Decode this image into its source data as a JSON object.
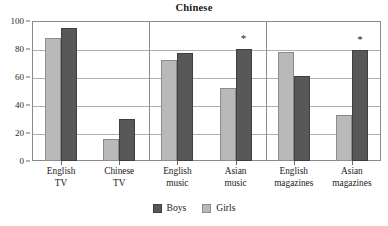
{
  "chart_data": {
    "type": "bar",
    "title": "Chinese",
    "xlabel": "",
    "ylabel": "",
    "ylim": [
      0,
      100
    ],
    "yticks": [
      0,
      20,
      40,
      60,
      80,
      100
    ],
    "ytick_labels": [
      "0",
      "20",
      "40",
      "60",
      "80",
      "100"
    ],
    "grid": true,
    "legend_position": "bottom",
    "categories": [
      "English TV",
      "Chinese TV",
      "English music",
      "Asian music",
      "English magazines",
      "Asian magazines"
    ],
    "category_lines": [
      [
        "English",
        "TV"
      ],
      [
        "Chinese",
        "TV"
      ],
      [
        "English",
        "music"
      ],
      [
        "Asian",
        "music"
      ],
      [
        "English",
        "magazines"
      ],
      [
        "Asian",
        "magazines"
      ]
    ],
    "series": [
      {
        "name": "Girls",
        "color": "#b9b9b9",
        "values": [
          88,
          16,
          72,
          52,
          78,
          33
        ]
      },
      {
        "name": "Boys",
        "color": "#585858",
        "values": [
          95,
          30,
          77,
          80,
          61,
          79
        ]
      }
    ],
    "legend_order": [
      "Boys",
      "Girls"
    ],
    "annotations": [
      {
        "symbol": "*",
        "category": "Asian music",
        "series": "Boys",
        "value": 80
      },
      {
        "symbol": "*",
        "category": "Asian magazines",
        "series": "Boys",
        "value": 79
      }
    ],
    "panel_groups": [
      [
        "English TV",
        "Chinese TV"
      ],
      [
        "English music",
        "Asian music"
      ],
      [
        "English magazines",
        "Asian magazines"
      ]
    ]
  }
}
